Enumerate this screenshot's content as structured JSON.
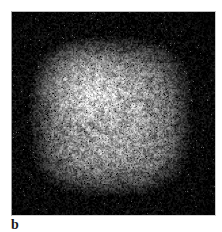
{
  "figure": {
    "panel_label": "b",
    "background_color": "#ffffff",
    "panel": {
      "x": 11,
      "y": 11,
      "width": 205,
      "height": 205,
      "background_color": "#000000",
      "border_color": "#b9b9b9"
    }
  },
  "chart_data": {
    "type": "heatmap",
    "title": "",
    "subtitle": "",
    "xlabel": "",
    "ylabel": "",
    "annotations": [
      "b"
    ],
    "legend": [],
    "grid": false,
    "colormap": "grayscale",
    "value_range": [
      0,
      255
    ],
    "background_value": 0,
    "blob": {
      "center_x": 110,
      "center_y": 116,
      "radius_x": 84,
      "radius_y": 82,
      "peak_intensity": 168,
      "edge_intensity": 8,
      "falloff_exponent": 2.6,
      "hot_spot": {
        "x": 78,
        "y": 74,
        "intensity": 176,
        "radius": 52
      },
      "grain_amplitude": 58,
      "grain_scale": 1.35,
      "speckle_density": 0.34
    },
    "extent": {
      "left": 22,
      "right": 198,
      "top": 34,
      "bottom": 200
    },
    "intensity_samples": [
      {
        "x": 30,
        "y": 110,
        "value": 44
      },
      {
        "x": 50,
        "y": 110,
        "value": 104
      },
      {
        "x": 70,
        "y": 110,
        "value": 142
      },
      {
        "x": 90,
        "y": 110,
        "value": 152
      },
      {
        "x": 110,
        "y": 110,
        "value": 150
      },
      {
        "x": 130,
        "y": 110,
        "value": 140
      },
      {
        "x": 150,
        "y": 110,
        "value": 126
      },
      {
        "x": 170,
        "y": 110,
        "value": 88
      },
      {
        "x": 190,
        "y": 110,
        "value": 30
      },
      {
        "x": 110,
        "y": 40,
        "value": 40
      },
      {
        "x": 110,
        "y": 60,
        "value": 118
      },
      {
        "x": 110,
        "y": 80,
        "value": 150
      },
      {
        "x": 110,
        "y": 140,
        "value": 132
      },
      {
        "x": 110,
        "y": 170,
        "value": 92
      },
      {
        "x": 110,
        "y": 195,
        "value": 26
      }
    ]
  }
}
